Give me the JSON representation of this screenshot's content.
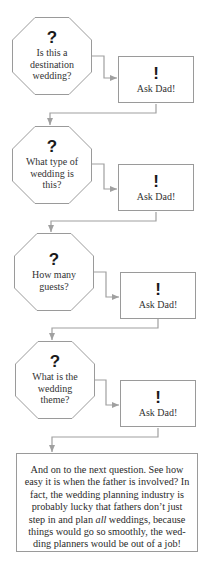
{
  "flowchart": {
    "steps": [
      {
        "question_icon": "?",
        "question": "Is this a destination wedding?",
        "answer_icon": "!",
        "answer": "Ask Dad!"
      },
      {
        "question_icon": "?",
        "question": "What type of wedding is this?",
        "answer_icon": "!",
        "answer": "Ask Dad!"
      },
      {
        "question_icon": "?",
        "question": "How many guests?",
        "answer_icon": "!",
        "answer": "Ask Dad!"
      },
      {
        "question_icon": "?",
        "question": "What is the wedding theme?",
        "answer_icon": "!",
        "answer": "Ask Dad!"
      }
    ],
    "conclusion": {
      "before_italic": "And on to the next question. See how easy it is when the father is involved? In fact, the wedding planning industry is probably lucky that fathers don’t just step in and plan ",
      "italic": "all",
      "after_italic": " weddings, because things would go so smoothly, the wed­ding planners would be out of a job!"
    },
    "colors": {
      "border": "#9a9a9a",
      "connector": "#a0a0a0",
      "text": "#333333",
      "glyph": "#1a1a1a",
      "background": "#ffffff"
    }
  }
}
